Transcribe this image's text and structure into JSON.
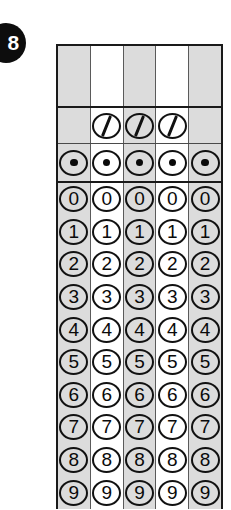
{
  "question": {
    "number": "8",
    "badge_bg": "#0d0d0d",
    "badge_fg": "#ffffff"
  },
  "grid": {
    "type": "student-produced-response-grid",
    "columns": 5,
    "column_shading": [
      "shaded",
      "plain",
      "shaded",
      "plain",
      "shaded"
    ],
    "shade_color": "#dcdcdc",
    "plain_color": "#ffffff",
    "border_color": "#1a1a1a",
    "ink_color": "#0a0a0a",
    "sections": [
      {
        "name": "write-in-boxes",
        "kind": "blank",
        "cells": [
          "",
          "",
          "",
          "",
          ""
        ]
      },
      {
        "name": "fraction-bar-row",
        "kind": "slash",
        "symbol": "/",
        "present": [
          false,
          true,
          true,
          true,
          false
        ]
      },
      {
        "name": "decimal-point-row",
        "kind": "dot",
        "symbol": ".",
        "present": [
          true,
          true,
          true,
          true,
          true
        ]
      }
    ],
    "digit_rows": [
      "0",
      "1",
      "2",
      "3",
      "4",
      "5",
      "6",
      "7",
      "8",
      "9"
    ]
  }
}
